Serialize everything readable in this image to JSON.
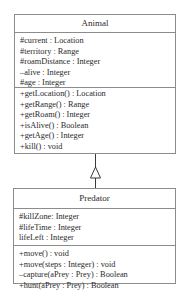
{
  "diagram": {
    "type": "uml-class-diagram",
    "classes": [
      {
        "name": "Animal",
        "attributes": [
          "#current : Location",
          "#territory : Range",
          "#roamDistance : Integer",
          "–alive : Integer",
          "#age : Integer"
        ],
        "methods": [
          "+getLocation() : Location",
          "+getRange() : Range",
          "+getRoam() : Integer",
          "+isAlive() : Boolean",
          "+getAge() : Integer",
          "+kill() : void"
        ]
      },
      {
        "name": "Predator",
        "attributes": [
          "#killZone: Integer",
          "#lifeTime : Integer",
          "lifeLeft : Integer"
        ],
        "methods": [
          "+move() : void",
          "+move(steps : Integer) : void",
          "–capture(aPrey : Prey) : Boolean",
          "+hunt(aPrey : Prey) : Boolean"
        ]
      }
    ],
    "relationships": [
      {
        "type": "generalization",
        "from": "Predator",
        "to": "Animal",
        "arrow": "hollow-triangle"
      }
    ]
  }
}
